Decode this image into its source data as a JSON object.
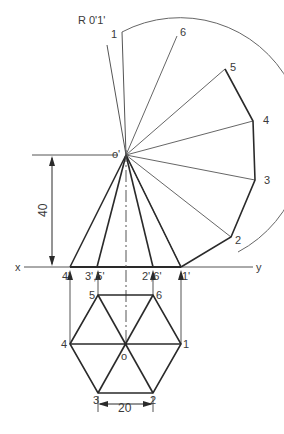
{
  "diagram": {
    "colors": {
      "line": "#2a2a2a",
      "thin": "#555555",
      "text": "#3a3a3a",
      "background": "#ffffff"
    },
    "labels": {
      "radius": "R 0'1'",
      "apex_front": "o'",
      "apex_top": "o",
      "axis_x": "x",
      "axis_y": "y",
      "height_dim": "40",
      "side_dim": "20",
      "front_4": "4'",
      "front_35": "3',5'",
      "front_26": "2',6'",
      "front_1": "1'",
      "arc_1": "1",
      "arc_6": "6",
      "arc_5": "5",
      "arc_4": "4",
      "arc_3": "3",
      "arc_2": "2",
      "top_1": "1",
      "top_2": "2",
      "top_3": "3",
      "top_4": "4",
      "top_5": "5",
      "top_6": "6"
    },
    "dimensions": {
      "height": 40,
      "side": 20
    }
  }
}
